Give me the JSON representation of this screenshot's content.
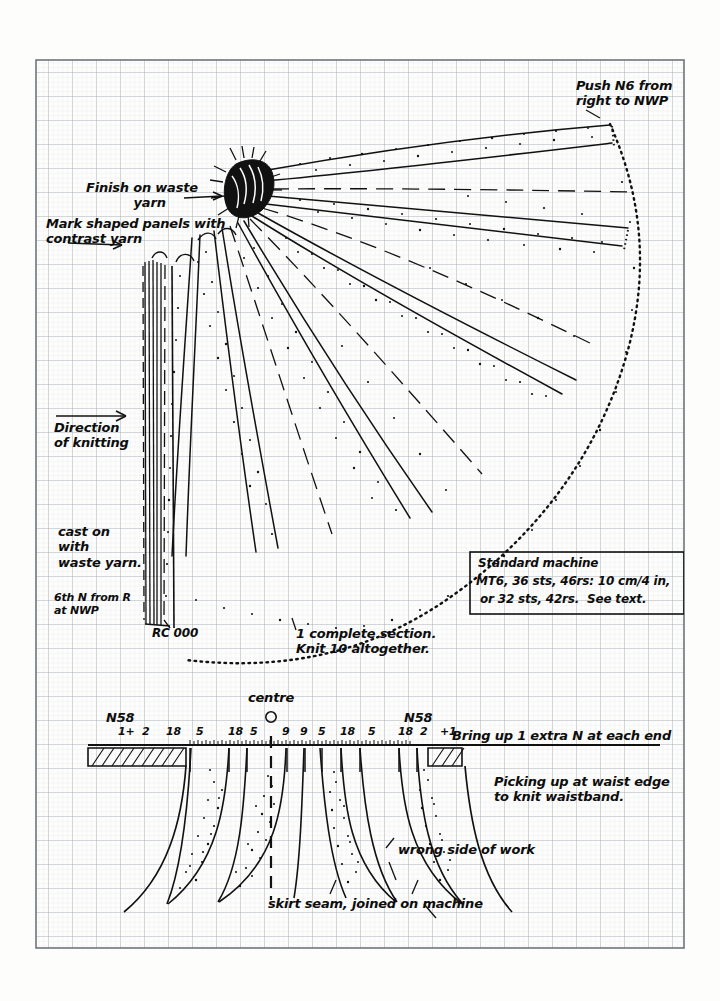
{
  "document": {
    "title": "Knitting machine skirt panel schematic",
    "type": "hand-drawn technical diagram on graph paper",
    "ink_color": "#111111",
    "paper_color": "#fdfdfc",
    "grid_color": "#b9bfc4"
  },
  "annotations": {
    "push_needle": "Push N6 from\nright to NWP",
    "finish_waste": "Finish on waste\n           yarn",
    "mark_panels": "Mark shaped panels with\ncontrast yarn",
    "direction": "Direction\nof knitting",
    "cast_on": "cast on\nwith\nwaste yarn.",
    "sixth_needle": "6th N from R\nat NWP",
    "row_counter": "RC 000",
    "section_note": "1 complete section.\nKnit 10 altogether.",
    "bring_up": "Bring up 1 extra N at each end",
    "picking_up": "Picking up at waist edge\nto knit waistband.",
    "wrong_side": "wrong side of work",
    "skirt_seam": "skirt seam, joined on machine",
    "centre": "centre",
    "needle_left": "N58",
    "needle_right": "N58"
  },
  "tension_box": {
    "line1": "Standard machine",
    "line2": "MT6, 36 sts, 46rs: 10 cm/4 in,",
    "line3": "or 32 sts, 42rs.  See text."
  },
  "needle_bed": {
    "centre_marker": "0",
    "left_end_label": "N58",
    "right_end_label": "N58",
    "counts": [
      "1+",
      "2",
      "18",
      "5",
      "18",
      "5",
      "9",
      "9",
      "5",
      "18",
      "5",
      "18",
      "2",
      "+1"
    ]
  },
  "chart_data": {
    "type": "diagram",
    "upper_fan": {
      "description": "Fan-shaped skirt section knitted sideways, 1 complete section of 10",
      "apex": "waste yarn bundle at top left of fan",
      "wedges": 7,
      "hem_edge": "dotted arc",
      "cast_on_edge": "vertical bundle of waste yarn lines at left"
    },
    "lower_bed": {
      "description": "needle bed with darts picked up at waist edge",
      "darts": 4,
      "centre_line": "dashed vertical"
    }
  }
}
